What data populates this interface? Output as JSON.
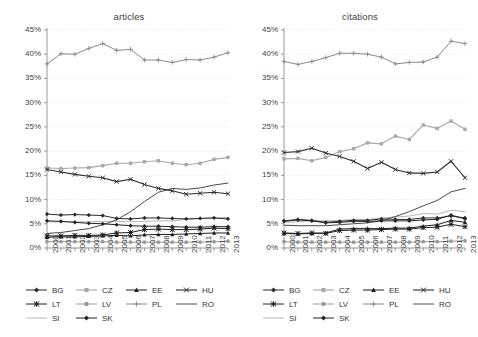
{
  "figure": {
    "background": "#ffffff",
    "width": 473,
    "height": 337
  },
  "panels": [
    {
      "key": "articles",
      "title": "articles"
    },
    {
      "key": "citations",
      "title": "citations"
    }
  ],
  "axis": {
    "y_ticks": [
      "0%",
      "5%",
      "10%",
      "15%",
      "20%",
      "25%",
      "30%",
      "35%",
      "40%",
      "45%"
    ],
    "x_ticks": [
      "2000",
      "2001",
      "2002",
      "2003",
      "2004",
      "2005",
      "2006",
      "2007",
      "2008",
      "2009",
      "2010",
      "2011",
      "2012",
      "2013"
    ]
  },
  "legend": {
    "rows": [
      [
        {
          "key": "BG",
          "label": "BG"
        },
        {
          "key": "CZ",
          "label": "CZ"
        },
        {
          "key": "EE",
          "label": "EE"
        },
        {
          "key": "HU",
          "label": "HU"
        }
      ],
      [
        {
          "key": "LT",
          "label": "LT"
        },
        {
          "key": "LV",
          "label": "LV"
        },
        {
          "key": "PL",
          "label": "PL"
        },
        {
          "key": "RO",
          "label": "RO"
        }
      ],
      [
        {
          "key": "SI",
          "label": "SI"
        },
        {
          "key": "SK",
          "label": "SK"
        }
      ]
    ]
  },
  "style": {
    "series": {
      "BG": {
        "color": "#2a2a2a",
        "marker": "diamond",
        "width": 1.0
      },
      "CZ": {
        "color": "#a8a8a8",
        "marker": "square",
        "width": 1.1
      },
      "EE": {
        "color": "#1f1f1f",
        "marker": "triangle",
        "width": 1.0
      },
      "HU": {
        "color": "#2d2d2d",
        "marker": "cross",
        "width": 1.1
      },
      "LT": {
        "color": "#1f1f1f",
        "marker": "star",
        "width": 1.0
      },
      "LV": {
        "color": "#999999",
        "marker": "circle",
        "width": 1.0
      },
      "PL": {
        "color": "#8a8a8a",
        "marker": "plus",
        "width": 1.0
      },
      "RO": {
        "color": "#4a4a4a",
        "marker": "none",
        "width": 1.0
      },
      "SI": {
        "color": "#b5b5b5",
        "marker": "none",
        "width": 1.0
      },
      "SK": {
        "color": "#222222",
        "marker": "diamond",
        "width": 1.0
      }
    },
    "grid_color": "#e2e2e2",
    "axis_color": "#9a9a9a"
  },
  "chart_data": [
    {
      "type": "line",
      "title": "articles",
      "xlabel": "",
      "ylabel": "",
      "ylim": [
        0,
        45
      ],
      "grid": true,
      "legend_position": "bottom",
      "x": [
        "2000",
        "2001",
        "2002",
        "2003",
        "2004",
        "2005",
        "2006",
        "2007",
        "2008",
        "2009",
        "2010",
        "2011",
        "2012",
        "2013"
      ],
      "series": [
        {
          "name": "BG",
          "values": [
            7.0,
            6.8,
            6.9,
            6.8,
            6.7,
            6.1,
            6.0,
            6.2,
            6.2,
            6.1,
            6.0,
            6.1,
            6.2,
            6.0
          ]
        },
        {
          "name": "CZ",
          "values": [
            16.5,
            16.4,
            16.5,
            16.6,
            17.0,
            17.5,
            17.5,
            17.8,
            18.0,
            17.5,
            17.2,
            17.5,
            18.3,
            18.7
          ]
        },
        {
          "name": "EE",
          "values": [
            2.2,
            2.3,
            2.3,
            2.4,
            2.5,
            2.6,
            2.5,
            2.7,
            2.8,
            2.8,
            2.9,
            3.0,
            3.1,
            3.1
          ]
        },
        {
          "name": "HU",
          "values": [
            16.2,
            15.7,
            15.2,
            14.8,
            14.5,
            13.7,
            14.2,
            13.1,
            12.3,
            11.8,
            11.1,
            11.3,
            11.5,
            11.2
          ]
        },
        {
          "name": "LT",
          "values": [
            2.5,
            2.5,
            2.6,
            2.6,
            2.7,
            3.1,
            3.2,
            3.8,
            3.9,
            3.8,
            3.8,
            3.9,
            4.1,
            4.0
          ]
        },
        {
          "name": "LV",
          "values": [
            1.3,
            1.3,
            1.3,
            1.3,
            1.3,
            1.2,
            1.2,
            1.2,
            1.2,
            1.2,
            1.2,
            1.2,
            1.3,
            1.4
          ]
        },
        {
          "name": "PL",
          "values": [
            38.0,
            40.1,
            40.0,
            41.2,
            42.2,
            40.8,
            41.0,
            38.8,
            38.8,
            38.3,
            38.9,
            38.8,
            39.4,
            40.3
          ]
        },
        {
          "name": "RO",
          "values": [
            3.0,
            3.2,
            3.6,
            4.0,
            4.8,
            5.8,
            7.5,
            9.6,
            11.5,
            12.3,
            12.1,
            12.4,
            13.0,
            13.4
          ]
        },
        {
          "name": "SI",
          "values": [
            5.4,
            5.4,
            5.4,
            5.4,
            5.5,
            5.5,
            5.4,
            5.5,
            5.6,
            5.6,
            5.9,
            6.1,
            6.2,
            6.3
          ]
        },
        {
          "name": "SK",
          "values": [
            5.6,
            5.5,
            5.3,
            5.1,
            5.0,
            4.8,
            4.6,
            4.5,
            4.5,
            4.4,
            4.3,
            4.3,
            4.4,
            4.4
          ]
        }
      ]
    },
    {
      "type": "line",
      "title": "citations",
      "xlabel": "",
      "ylabel": "",
      "ylim": [
        0,
        45
      ],
      "grid": true,
      "legend_position": "bottom",
      "x": [
        "2000",
        "2001",
        "2002",
        "2003",
        "2004",
        "2005",
        "2006",
        "2007",
        "2008",
        "2009",
        "2010",
        "2011",
        "2012",
        "2013"
      ],
      "series": [
        {
          "name": "BG",
          "values": [
            5.6,
            5.9,
            5.7,
            5.3,
            5.5,
            5.7,
            5.7,
            6.0,
            5.9,
            5.9,
            6.2,
            6.2,
            6.6,
            6.2
          ]
        },
        {
          "name": "CZ",
          "values": [
            18.4,
            18.5,
            18.0,
            18.7,
            19.9,
            20.5,
            21.7,
            21.5,
            23.1,
            22.4,
            25.4,
            24.7,
            26.2,
            24.5
          ]
        },
        {
          "name": "EE",
          "values": [
            3.0,
            2.9,
            3.0,
            3.1,
            3.9,
            4.0,
            4.0,
            4.0,
            4.1,
            4.1,
            4.5,
            4.8,
            5.7,
            5.3
          ]
        },
        {
          "name": "HU",
          "values": [
            19.7,
            19.9,
            20.6,
            19.6,
            18.9,
            17.9,
            16.4,
            17.7,
            16.2,
            15.5,
            15.4,
            15.7,
            17.9,
            14.5
          ]
        },
        {
          "name": "LT",
          "values": [
            3.1,
            3.0,
            3.1,
            3.0,
            3.6,
            3.7,
            3.7,
            3.8,
            3.9,
            3.9,
            4.2,
            4.3,
            4.9,
            4.4
          ]
        },
        {
          "name": "LV",
          "values": [
            1.3,
            1.2,
            1.2,
            1.2,
            1.2,
            1.2,
            1.2,
            1.2,
            1.2,
            1.2,
            1.3,
            1.3,
            1.4,
            1.5
          ]
        },
        {
          "name": "PL",
          "values": [
            38.5,
            37.9,
            38.5,
            39.3,
            40.2,
            40.2,
            40.0,
            39.4,
            38.0,
            38.3,
            38.4,
            39.4,
            42.7,
            42.2
          ]
        },
        {
          "name": "RO",
          "values": [
            4.7,
            4.6,
            4.6,
            4.6,
            4.8,
            5.0,
            5.2,
            5.6,
            6.5,
            7.5,
            8.7,
            9.8,
            11.6,
            12.3
          ]
        },
        {
          "name": "SI",
          "values": [
            5.3,
            5.4,
            5.6,
            5.6,
            5.7,
            5.9,
            5.9,
            6.2,
            6.4,
            6.6,
            7.1,
            7.0,
            7.8,
            7.5
          ]
        },
        {
          "name": "SK",
          "values": [
            5.5,
            5.8,
            5.6,
            5.2,
            5.3,
            5.5,
            5.5,
            5.6,
            5.6,
            5.6,
            5.8,
            5.9,
            6.8,
            6.0
          ]
        }
      ]
    }
  ]
}
